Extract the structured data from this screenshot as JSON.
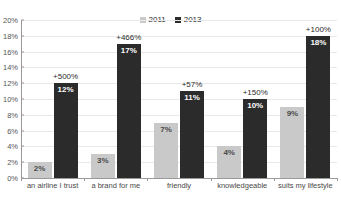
{
  "chart_data": {
    "type": "bar",
    "title": "",
    "xlabel": "",
    "ylabel": "",
    "ylim": [
      0,
      20
    ],
    "grid": true,
    "legend_position": "top-center",
    "categories": [
      "an airline I trust",
      "a brand for me",
      "friendly",
      "knowledgeable",
      "suits my lifestyle"
    ],
    "series": [
      {
        "name": "2011",
        "color": "#c9c9c9",
        "values": [
          2,
          3,
          7,
          4,
          9
        ],
        "value_labels": [
          "2%",
          "3%",
          "7%",
          "4%",
          "9%"
        ]
      },
      {
        "name": "2013",
        "color": "#2b2b2b",
        "values": [
          12,
          17,
          11,
          10,
          18
        ],
        "value_labels": [
          "12%",
          "17%",
          "11%",
          "10%",
          "18%"
        ]
      }
    ],
    "annotations": [
      "+500%",
      "+466%",
      "+57%",
      "+150%",
      "+100%"
    ],
    "y_ticks": [
      "0%",
      "2%",
      "4%",
      "6%",
      "8%",
      "10%",
      "12%",
      "14%",
      "16%",
      "18%",
      "20%"
    ],
    "y_tick_values": [
      0,
      2,
      4,
      6,
      8,
      10,
      12,
      14,
      16,
      18,
      20
    ]
  },
  "legend": {
    "items": [
      {
        "label": "2011",
        "color": "#c9c9c9"
      },
      {
        "label": "2013",
        "color": "#2b2b2b"
      }
    ]
  }
}
